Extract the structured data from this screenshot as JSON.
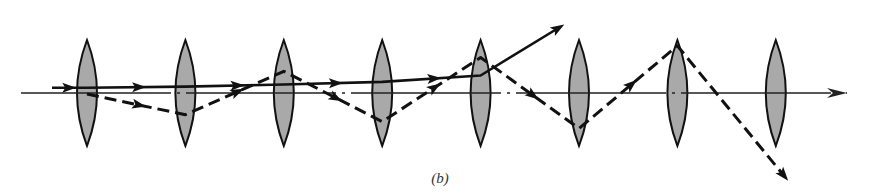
{
  "figure": {
    "caption": "(b)",
    "colors": {
      "lens_fill": "#a9a9a9",
      "lens_stroke": "#111111",
      "ray": "#111111",
      "axis": "#222222"
    }
  },
  "lenses": {
    "count": 8,
    "label": "thin lens"
  },
  "optical_axis": {
    "label": "optical axis",
    "style": "dash-dot",
    "arrow": true
  },
  "rays": [
    {
      "name": "solid-ray",
      "style": "solid",
      "behavior": "slowly diverging",
      "height_at_lens": [
        0.1,
        0.12,
        0.16,
        0.21,
        0.33,
        null,
        null,
        null
      ]
    },
    {
      "name": "dashed-ray",
      "style": "dashed",
      "behavior": "growing oscillation (unstable)",
      "height_at_lens": [
        -0.02,
        -0.41,
        0.41,
        -0.54,
        0.67,
        -0.67,
        0.89,
        null
      ]
    }
  ]
}
